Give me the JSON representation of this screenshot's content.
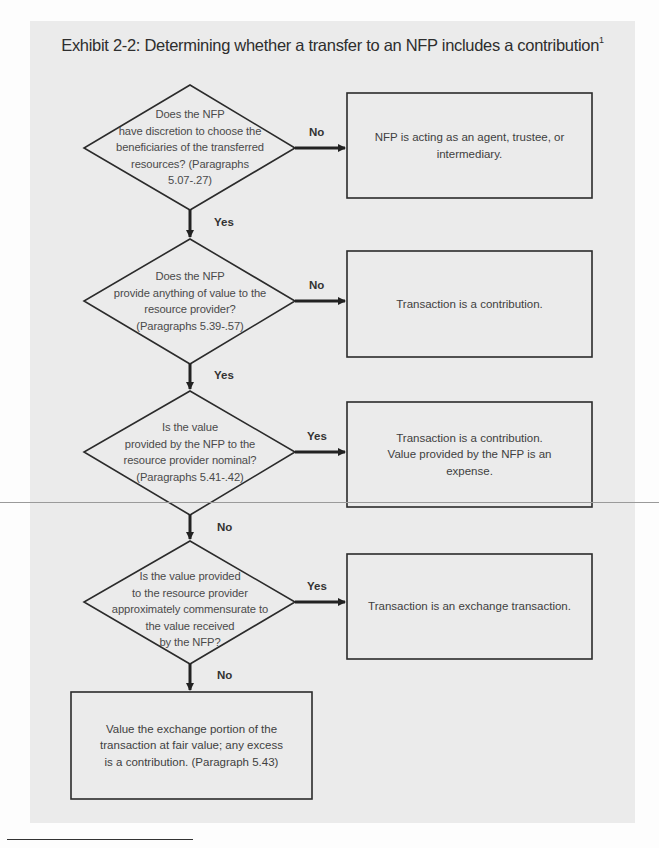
{
  "title": {
    "text": "Exhibit 2-2: Determining whether a transfer to an NFP includes a contribution",
    "footnote_marker": "1"
  },
  "decisions": [
    {
      "id": "d1",
      "lines": [
        "Does the NFP",
        "have discretion to choose the",
        "beneficiaries of the transferred",
        "resources? (Paragraphs",
        "5.07-.27)"
      ],
      "right_label": "No",
      "down_label": "Yes"
    },
    {
      "id": "d2",
      "lines": [
        "Does the NFP",
        "provide anything of value to the",
        "resource provider?",
        "(Paragraphs 5.39-.57)"
      ],
      "right_label": "No",
      "down_label": "Yes"
    },
    {
      "id": "d3",
      "lines": [
        "Is the value",
        "provided by the NFP to the",
        "resource provider nominal?",
        "(Paragraphs 5.41-.42)"
      ],
      "right_label": "Yes",
      "down_label": "No"
    },
    {
      "id": "d4",
      "lines": [
        "Is the value provided",
        "to the resource provider",
        "approximately commensurate to",
        "the value received",
        "by the NFP?"
      ],
      "right_label": "Yes",
      "down_label": "No"
    }
  ],
  "outcomes": [
    {
      "id": "o1",
      "lines": [
        "NFP is acting as an agent, trustee, or",
        "intermediary."
      ]
    },
    {
      "id": "o2",
      "lines": [
        "Transaction is a contribution."
      ]
    },
    {
      "id": "o3",
      "lines": [
        "Transaction is a contribution.",
        "Value provided by the NFP is an",
        "expense."
      ]
    },
    {
      "id": "o4",
      "lines": [
        "Transaction is an exchange transaction."
      ]
    },
    {
      "id": "o5",
      "lines": [
        "Value the exchange portion of the",
        "transaction at fair value; any excess",
        "is a contribution. (Paragraph 5.43)"
      ]
    }
  ],
  "colors": {
    "panel": "#ebebeb",
    "stroke": "#2b2b2b",
    "text": "#404040"
  }
}
